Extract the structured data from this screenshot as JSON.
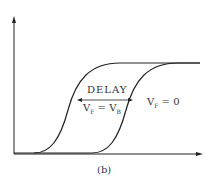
{
  "diagram": {
    "delay_label": "DELAY",
    "left_curve_label": {
      "v": "V",
      "sub1": "F",
      "eq": " = V",
      "sub2": "B"
    },
    "right_curve_label": {
      "v": "V",
      "sub1": "F",
      "eq": " = 0"
    },
    "caption": "(b)"
  },
  "colors": {
    "stroke": "#222222",
    "text": "#333333"
  }
}
